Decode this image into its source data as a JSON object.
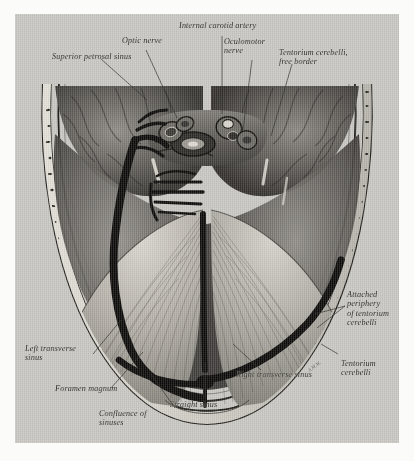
{
  "plate": {
    "title": "Superior view of the cranial base: tentorium cerebelli and dural venous sinuses",
    "background_color": "#c9c7c2",
    "page_color": "#fbfbfa",
    "ink_color": "#2a2823"
  },
  "labels": [
    {
      "id": "superior-petrosal-sinus",
      "text": "Superior petrosal sinus"
    },
    {
      "id": "optic-nerve",
      "text": "Optic nerve"
    },
    {
      "id": "internal-carotid-artery",
      "text": "Internal carotid artery"
    },
    {
      "id": "oculomotor-nerve",
      "text": "Oculomotor\nnerve"
    },
    {
      "id": "tentorium-cerebelli-free-border",
      "text": "Tentorium cerebelli,\nfree border"
    },
    {
      "id": "attached-periphery-of-tentorium-cerebelli",
      "text": "Attached\nperiphery\nof tentorium\ncerebelli"
    },
    {
      "id": "tentorium-cerebelli",
      "text": "Tentorium\ncerebelli"
    },
    {
      "id": "right-transverse-sinus",
      "text": "Right transverse sinus"
    },
    {
      "id": "straight-sinus",
      "text": "Straight sinus"
    },
    {
      "id": "confluence-of-sinuses",
      "text": "Confluence of\nsinuses"
    },
    {
      "id": "foramen-magnum",
      "text": "Foramen magnum"
    },
    {
      "id": "left-transverse-sinus",
      "text": "Left transverse\nsinus"
    }
  ],
  "signature": "A.M.W."
}
